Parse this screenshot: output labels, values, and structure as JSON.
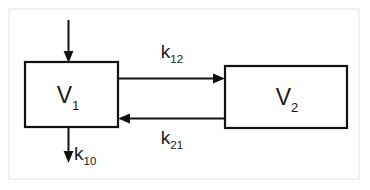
{
  "diagram": {
    "background_color": "#ffffff",
    "stroke_color": "#111111",
    "frame_color": "#f2f2f2",
    "compartments": [
      {
        "id": "v1",
        "label": "V",
        "subscript": "1",
        "full_label": "V1",
        "x": 25,
        "y": 62,
        "width": 93,
        "height": 65
      },
      {
        "id": "v2",
        "label": "V",
        "subscript": "2",
        "full_label": "V2",
        "x": 225,
        "y": 66,
        "width": 122,
        "height": 62
      }
    ],
    "flows": [
      {
        "id": "input",
        "label": "",
        "subscript": "",
        "direction": "down",
        "description": "input-arrow-into-v1"
      },
      {
        "id": "k12",
        "label": "k",
        "subscript": "12",
        "full_label": "k12",
        "direction": "right",
        "description": "v1-to-v2-transfer"
      },
      {
        "id": "k21",
        "label": "k",
        "subscript": "21",
        "full_label": "k21",
        "direction": "left",
        "description": "v2-to-v1-transfer"
      },
      {
        "id": "k10",
        "label": "k",
        "subscript": "10",
        "full_label": "k10",
        "direction": "down",
        "description": "elimination-from-v1"
      }
    ]
  }
}
